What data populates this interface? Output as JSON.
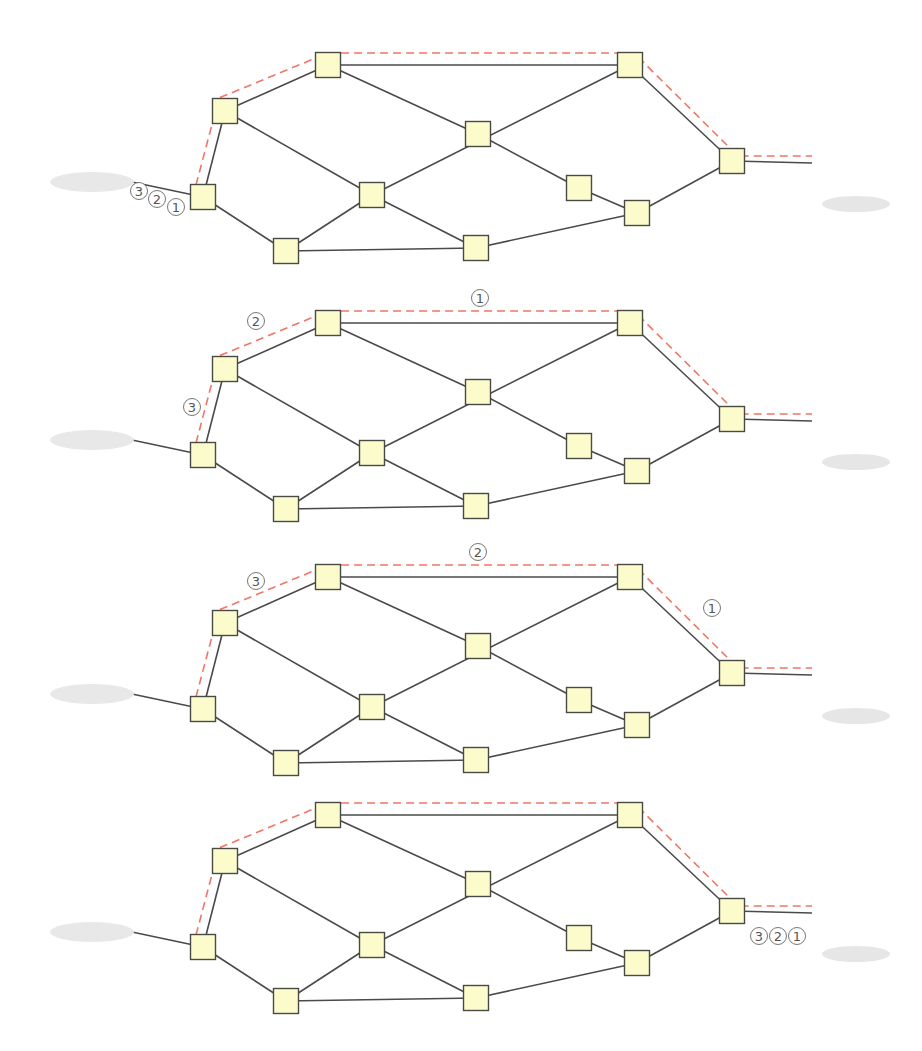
{
  "colors": {
    "node_fill": "#fbfbcc",
    "node_stroke": "#4a4a44",
    "link": "#4a4a4a",
    "route_dashed": "#ee7766",
    "packet_label": "#555555"
  },
  "panel_offsets": [
    0,
    258,
    512,
    750
  ],
  "endpoints": {
    "source": {
      "name": "computer",
      "icon": "desktop-computer-icon"
    },
    "destination": {
      "name": "server",
      "icon": "server-icon"
    }
  },
  "nodes": [
    {
      "id": "n0",
      "x": 203,
      "y": 197
    },
    {
      "id": "n1",
      "x": 225,
      "y": 111
    },
    {
      "id": "n2",
      "x": 328,
      "y": 65
    },
    {
      "id": "n3",
      "x": 630,
      "y": 65
    },
    {
      "id": "n4",
      "x": 478,
      "y": 134
    },
    {
      "id": "n5",
      "x": 372,
      "y": 195
    },
    {
      "id": "n6",
      "x": 579,
      "y": 188
    },
    {
      "id": "n7",
      "x": 637,
      "y": 213
    },
    {
      "id": "n8",
      "x": 732,
      "y": 161
    },
    {
      "id": "n9",
      "x": 286,
      "y": 251
    },
    {
      "id": "n10",
      "x": 476,
      "y": 248
    }
  ],
  "links": [
    [
      "pc",
      "n0"
    ],
    [
      "n0",
      "n1"
    ],
    [
      "n1",
      "n2"
    ],
    [
      "n2",
      "n3"
    ],
    [
      "n3",
      "n8"
    ],
    [
      "n8",
      "srv"
    ],
    [
      "n1",
      "n5"
    ],
    [
      "n2",
      "n4"
    ],
    [
      "n3",
      "n5"
    ],
    [
      "n4",
      "n6"
    ],
    [
      "n6",
      "n7"
    ],
    [
      "n7",
      "n8"
    ],
    [
      "n0",
      "n9"
    ],
    [
      "n9",
      "n5"
    ],
    [
      "n5",
      "n10"
    ],
    [
      "n9",
      "n10"
    ],
    [
      "n10",
      "n7"
    ]
  ],
  "route": [
    "n0",
    "n1",
    "n2",
    "n3",
    "n8",
    "srv"
  ],
  "panels": [
    {
      "step": 1,
      "packets": [
        {
          "label": "③",
          "x": 139,
          "y": 191
        },
        {
          "label": "②",
          "x": 157,
          "y": 199
        },
        {
          "label": "①",
          "x": 176,
          "y": 207
        }
      ]
    },
    {
      "step": 2,
      "packets": [
        {
          "label": "①",
          "x": 480,
          "y": 40
        },
        {
          "label": "②",
          "x": 256,
          "y": 63
        },
        {
          "label": "③",
          "x": 192,
          "y": 149
        }
      ]
    },
    {
      "step": 3,
      "packets": [
        {
          "label": "②",
          "x": 478,
          "y": 40
        },
        {
          "label": "③",
          "x": 256,
          "y": 69
        },
        {
          "label": "①",
          "x": 712,
          "y": 96
        }
      ]
    },
    {
      "step": 4,
      "packets": [
        {
          "label": "③",
          "x": 759,
          "y": 186
        },
        {
          "label": "②",
          "x": 778,
          "y": 186
        },
        {
          "label": "①",
          "x": 797,
          "y": 186
        }
      ]
    }
  ]
}
